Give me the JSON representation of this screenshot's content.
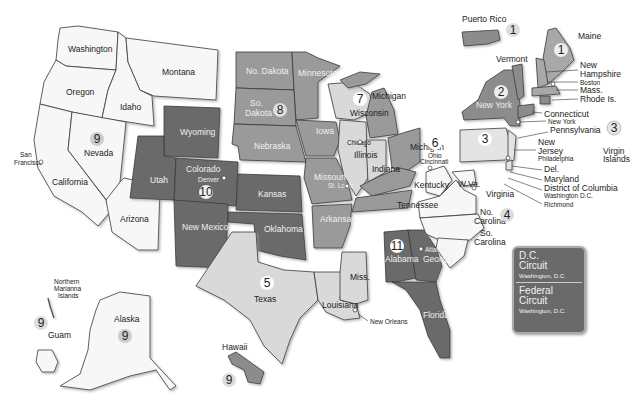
{
  "map": {
    "title": "Geographic Boundaries of United States Courts of Appeals and District Courts",
    "colors": {
      "light": "#f4f4f4",
      "pale": "#d9d9d9",
      "mid": "#9a9a9a",
      "dark": "#6b6b6b",
      "stroke": "#3a3a3a"
    },
    "circuits": [
      {
        "number": "1",
        "states": [
          "Maine",
          "New Hampshire",
          "Mass.",
          "Rhode Is.",
          "Puerto Rico"
        ],
        "seat": "Boston"
      },
      {
        "number": "2",
        "states": [
          "New York",
          "Vermont",
          "Connecticut"
        ],
        "seat": "New York"
      },
      {
        "number": "3",
        "states": [
          "Pennsylvania",
          "New Jersey",
          "Del.",
          "Virgin Islands"
        ],
        "seat": "Philadelphia"
      },
      {
        "number": "4",
        "states": [
          "Maryland",
          "W.Va.",
          "Virginia",
          "No. Carolina",
          "So. Carolina"
        ],
        "seat": "Richmond"
      },
      {
        "number": "5",
        "states": [
          "Texas",
          "Louisiana",
          "Miss."
        ],
        "seat": "New Orleans"
      },
      {
        "number": "6",
        "states": [
          "Michigan",
          "Ohio",
          "Kentucky",
          "Tennessee"
        ],
        "seat": "Cincinnati"
      },
      {
        "number": "7",
        "states": [
          "Wisconsin",
          "Illinois",
          "Indiana"
        ],
        "seat": "Chicago"
      },
      {
        "number": "8",
        "states": [
          "No. Dakota",
          "So. Dakota",
          "Nebraska",
          "Minnesota",
          "Iowa",
          "Missouri",
          "Arkansas"
        ],
        "seat": "St. Louis"
      },
      {
        "number": "9",
        "states": [
          "Washington",
          "Oregon",
          "California",
          "Nevada",
          "Idaho",
          "Montana",
          "Arizona",
          "Alaska",
          "Hawaii",
          "Guam",
          "Northern Marianna Islands"
        ],
        "seat": "San Francisco"
      },
      {
        "number": "10",
        "states": [
          "Wyoming",
          "Utah",
          "Colorado",
          "Kansas",
          "Oklahoma",
          "New Mexico"
        ],
        "seat": "Denver"
      },
      {
        "number": "11",
        "states": [
          "Alabama",
          "Georgia",
          "Florida"
        ],
        "seat": "Atlanta"
      }
    ],
    "labels": {
      "washington": "Washington",
      "oregon": "Oregon",
      "california": "California",
      "nevada": "Nevada",
      "idaho": "Idaho",
      "montana": "Montana",
      "arizona": "Arizona",
      "wyoming": "Wyoming",
      "utah": "Utah",
      "colorado": "Colorado",
      "denver": "Denver",
      "kansas": "Kansas",
      "oklahoma": "Oklahoma",
      "new_mexico": "New\nMexico",
      "no_dakota": "No. Dakota",
      "so_dakota_1": "So.",
      "so_dakota_2": "Dakota",
      "nebraska": "Nebraska",
      "minnesota": "Minnesota",
      "iowa": "Iowa",
      "missouri": "Missouri",
      "st_louis": "St. Louis",
      "arkansas": "Arkansas",
      "wisconsin": "Wisconsin",
      "chicago": "Chicago",
      "illinois": "Illinois",
      "indiana": "Indiana",
      "michigan_upper": "Michigan",
      "michigan": "Michigan",
      "ohio": "Ohio",
      "cincinnati": "Cincinnati",
      "kentucky": "Kentucky",
      "tennessee": "Tennessee",
      "texas": "Texas",
      "louisiana": "Louisiana",
      "miss": "Miss.",
      "new_orleans": "New Orleans",
      "alabama": "Alabama",
      "georgia": "Georgia",
      "atlanta": "Atlanta",
      "florida": "Florida",
      "wva": "W.Va.",
      "virginia": "Virginia",
      "no_carolina_1": "No.",
      "no_carolina_2": "Carolina",
      "so_carolina_1": "So.",
      "so_carolina_2": "Carolina",
      "new_york": "New York",
      "vermont": "Vermont",
      "pennsylvania": "Pennsylvania",
      "new_jersey_1": "New",
      "new_jersey_2": "Jersey",
      "philadelphia": "Philadelphia",
      "del": "Del.",
      "maryland": "Maryland",
      "dc": "District of Columbia",
      "washington_dc": "Washington D.C.",
      "richmond": "Richmond",
      "maine": "Maine",
      "new_hampshire_1": "New",
      "new_hampshire_2": "Hampshire",
      "boston": "Boston",
      "mass": "Mass.",
      "rhode_is": "Rhode Is.",
      "connecticut": "Connecticut",
      "new_york_city": "New York",
      "puerto_rico": "Puerto Rico",
      "virgin_islands_1": "Virgin",
      "virgin_islands_2": "Islands",
      "san_francisco_1": "San",
      "san_francisco_2": "Francisco",
      "northern_marianna_1": "Northern",
      "northern_marianna_2": "Marianna",
      "northern_marianna_3": "Islands",
      "guam": "Guam",
      "alaska": "Alaska",
      "hawaii": "Hawaii"
    },
    "circuit_badges": {
      "c1_pr": "1",
      "c1": "1",
      "c2": "2",
      "c3": "3",
      "c3_vi": "3",
      "c4": "4",
      "c5": "5",
      "c6": "6",
      "c7": "7",
      "c8": "8",
      "c9": "9",
      "c9_guam": "9",
      "c9_alaska": "9",
      "c9_hawaii": "9",
      "c10": "10",
      "c11": "11"
    }
  },
  "legend": {
    "dc_circuit": {
      "title_1": "D.C.",
      "title_2": "Circuit",
      "seat": "Washington, D.C."
    },
    "federal_circuit": {
      "title_1": "Federal",
      "title_2": "Circuit",
      "seat": "Washington, D.C."
    }
  }
}
